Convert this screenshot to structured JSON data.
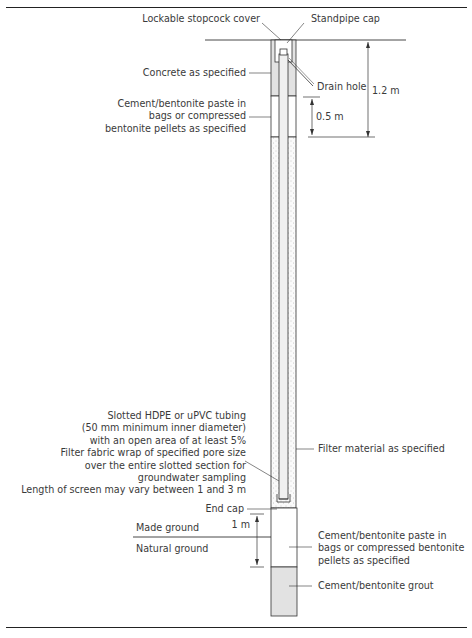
{
  "figure": {
    "labels": {
      "stopcock_cover": "Lockable stopcock cover",
      "standpipe_cap": "Standpipe cap",
      "concrete": "Concrete as specified",
      "drain_hole": "Drain hole",
      "seal_upper": [
        "Cement/bentonite paste in",
        "bags or compressed",
        "bentonite pellets as specified"
      ],
      "dim_total": "1.2 m",
      "dim_seal": "0.5 m",
      "screen_notes": [
        "Slotted HDPE or uPVC tubing",
        "(50 mm minimum inner diameter)",
        "with an open area of at least 5%",
        "Filter fabric wrap of specified pore size",
        "over the entire slotted section for",
        "groundwater sampling",
        "Length of screen may vary between 1 and 3 m"
      ],
      "filter": "Filter material as specified",
      "end_cap": "End cap",
      "dim_bottom": "1 m",
      "made_ground": "Made ground",
      "natural_ground": "Natural ground",
      "seal_lower": [
        "Cement/bentonite paste in",
        "bags or compressed bentonite",
        "pellets as specified"
      ],
      "grout": "Cement/bentonite grout"
    },
    "colors": {
      "line": "#333333",
      "concrete_fill": "#e2e2e2",
      "grout_fill": "#e2e2e2",
      "pipe_fill": "#f0f0f0",
      "filter_dots": "#9a9a9a"
    }
  }
}
